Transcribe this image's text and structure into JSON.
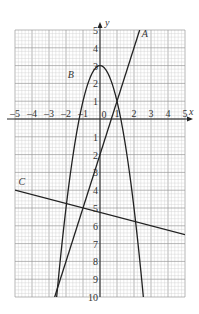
{
  "chart_data": {
    "type": "line",
    "title": "",
    "xlabel": "x",
    "ylabel": "y",
    "xlim": [
      -5,
      5
    ],
    "ylim": [
      -10,
      5
    ],
    "grid": true,
    "x_ticks": [
      "-5",
      "-4",
      "-3",
      "-2",
      "-1",
      "0",
      "1",
      "2",
      "3",
      "4",
      "5"
    ],
    "y_ticks": [
      "5",
      "4",
      "3",
      "2",
      "1",
      "-1",
      "-2",
      "-3",
      "-4",
      "-5",
      "-6",
      "-7",
      "-8",
      "-9",
      "-10"
    ],
    "series": [
      {
        "name": "A",
        "kind": "line",
        "equation": "y = 3x - 2",
        "points": [
          [
            -2.667,
            -10
          ],
          [
            2.333,
            5
          ]
        ]
      },
      {
        "name": "B",
        "kind": "parabola",
        "equation": "y = 3 - 2x^2",
        "vertex": [
          0,
          3
        ]
      },
      {
        "name": "C",
        "kind": "line",
        "equation": "y = -0.25x - 5.25",
        "points": [
          [
            -5,
            -4
          ],
          [
            5,
            -6.5
          ]
        ]
      }
    ]
  }
}
